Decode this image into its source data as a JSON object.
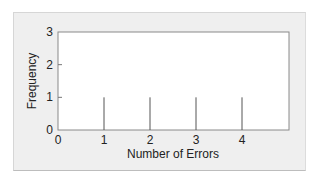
{
  "chart_data": {
    "type": "bar",
    "subtype": "spike",
    "title": "",
    "xlabel": "Number of Errors",
    "ylabel": "Frequency",
    "categories": [
      1,
      2,
      3,
      4
    ],
    "values": [
      1,
      1,
      1,
      1
    ],
    "x": [
      1,
      2,
      3,
      4
    ],
    "xlim": [
      0,
      5
    ],
    "ylim": [
      0,
      3
    ],
    "xticks": [
      "0",
      "1",
      "2",
      "3",
      "4"
    ],
    "yticks": [
      "0",
      "1",
      "2",
      "3"
    ],
    "grid": false,
    "legend": null
  },
  "colors": {
    "panel_bg": "#efefef",
    "plot_bg": "#ffffff",
    "axis": "#777777",
    "spike": "#555555"
  }
}
